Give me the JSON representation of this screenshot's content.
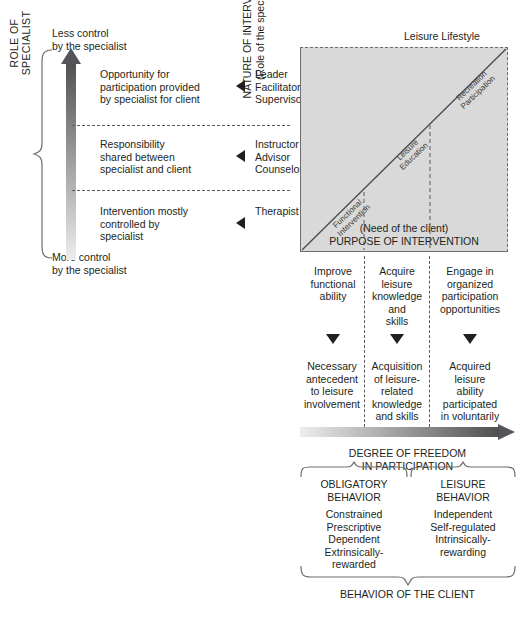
{
  "left_panel": {
    "top_note": "Less control\nby the specialist",
    "bottom_note": "More control\nby the specialist",
    "role_axis_label": "ROLE OF SPECIALIST",
    "degree_axis_label": "DEGREE OF CONTROL",
    "rows": [
      {
        "description": "Opportunity for\nparticipation provided\nby specialist for client",
        "roles": "Leader\nFacilitator\nSupervisor"
      },
      {
        "description": "Responsibility\nshared between\nspecialist and client",
        "roles": "Instructor\nAdvisor\nCounselor"
      },
      {
        "description": "Intervention mostly\ncontrolled by\nspecialist",
        "roles": "Therapist"
      }
    ]
  },
  "matrix": {
    "corner_label": "Leisure Lifestyle",
    "y_axis_label": "NATURE OF INTERVENTION\n(Role of the specialist)",
    "x_axis_label": "(Need of the client)\nPURPOSE OF INTERVENTION",
    "diagonal_labels": [
      "Functional\nIntervention",
      "Leisure\nEducation",
      "Recreation\nParticipation"
    ]
  },
  "columns": [
    {
      "top": "Improve\nfunctional\nability",
      "bottom": "Necessary\nantecedent\nto leisure\ninvolvement"
    },
    {
      "top": "Acquire\nleisure\nknowledge\nand\nskills",
      "bottom": "Acquisition\nof leisure-\nrelated\nknowledge\nand skills"
    },
    {
      "top": "Engage in\norganized\nparticipation\nopportunities",
      "bottom": "Acquired\nleisure\nability\nparticipated\nin voluntarily"
    }
  ],
  "freedom_axis_label": "DEGREE OF FREEDOM\nIN PARTICIPATION",
  "behaviors": [
    {
      "title": "OBLIGATORY\nBEHAVIOR",
      "traits": "Constrained\nPrescriptive\nDependent\nExtrinsically-\nrewarded"
    },
    {
      "title": "LEISURE\nBEHAVIOR",
      "traits": "Independent\nSelf-regulated\nIntrinsically-\nrewarding"
    }
  ],
  "behavior_client_label": "BEHAVIOR OF THE CLIENT",
  "colors": {
    "matrix_fill": "#d9d9d9",
    "ink": "#231f20",
    "dash": "#5b5b5b",
    "gradient_dark": "#58595b",
    "gradient_light": "#e6e6e6"
  }
}
